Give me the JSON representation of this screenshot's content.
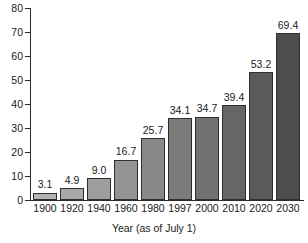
{
  "chart_data": {
    "type": "bar",
    "title": "",
    "subtitle": "",
    "xlabel": "Year (as of July 1)",
    "ylabel": "",
    "categories": [
      "1900",
      "1920",
      "1940",
      "1960",
      "1980",
      "1997",
      "2000",
      "2010",
      "2020",
      "2030"
    ],
    "values": [
      3.1,
      4.9,
      9.0,
      16.7,
      25.7,
      34.1,
      34.7,
      39.4,
      53.2,
      69.4
    ],
    "value_labels": [
      "3.1",
      "4.9",
      "9.0",
      "16.7",
      "25.7",
      "34.1",
      "34.7",
      "39.4",
      "53.2",
      "69.4"
    ],
    "ylim": [
      0,
      80
    ],
    "ytick_labels": [
      "0",
      "10",
      "20",
      "30",
      "40",
      "50",
      "60",
      "70",
      "80"
    ],
    "ytick_values": [
      0,
      10,
      20,
      30,
      40,
      50,
      60,
      70,
      80
    ],
    "grid": false,
    "legend": false,
    "legend_position": "none",
    "bar_colors": [
      "#b4b4b4",
      "#a9a9a9",
      "#9e9e9e",
      "#949494",
      "#888888",
      "#7c7c7c",
      "#727272",
      "#666666",
      "#5a5a5a",
      "#4d4d4d"
    ],
    "bar_outline_color": "#2e2e2e",
    "axis_color": "#2b2b2b",
    "text_color": "#1a1a1a",
    "background_color": "#ffffff"
  }
}
